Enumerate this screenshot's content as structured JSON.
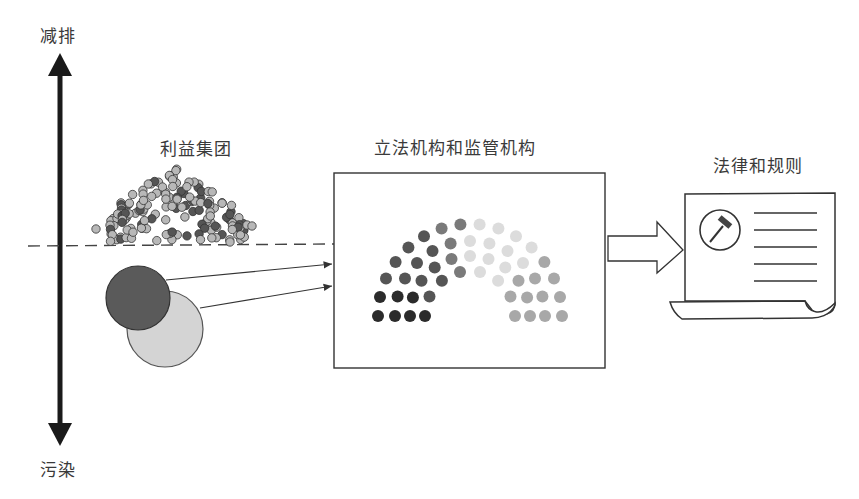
{
  "axis": {
    "top_label": "减排",
    "bottom_label": "污染"
  },
  "groups": {
    "interest_groups_label": "利益集团",
    "legislature_label": "立法机构和监管机构",
    "laws_label": "法律和规则"
  },
  "colors": {
    "axis": "#1a1a1a",
    "dark_seat": "#2b2b2b",
    "mid_dark_seat": "#555555",
    "mid_seat": "#7a7a7a",
    "light_seat": "#d9d9d9",
    "gray_seat": "#a8a8a8",
    "big_circle_dark": "#5a5a5a",
    "big_circle_light": "#d4d4d4",
    "line": "#333333"
  }
}
